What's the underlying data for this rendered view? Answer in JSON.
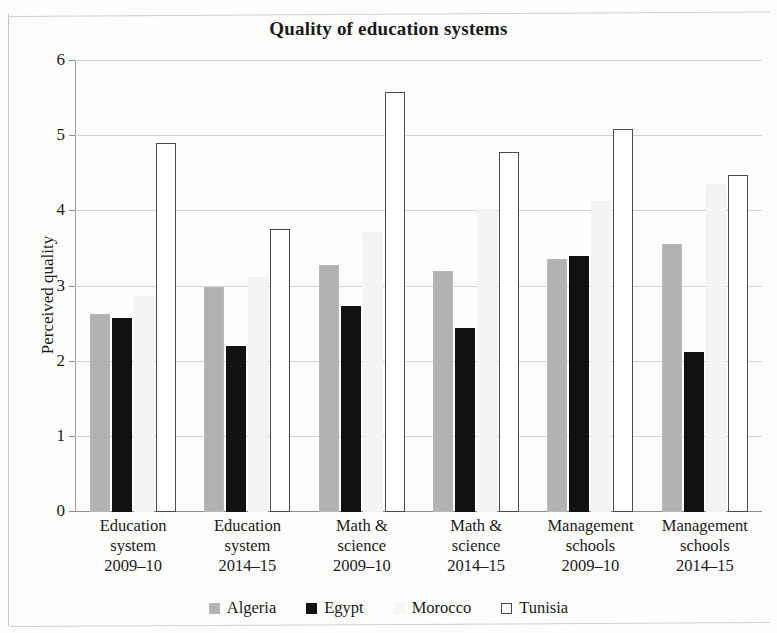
{
  "chart_data": {
    "type": "bar",
    "title": "Quality of education systems",
    "xlabel": "",
    "ylabel": "Perceived quality",
    "ylim": [
      0,
      6
    ],
    "ytick_labels": [
      "6",
      "5",
      "4",
      "3",
      "2",
      "1",
      "0"
    ],
    "yticks": [
      6,
      5,
      4,
      3,
      2,
      1,
      0
    ],
    "grid": true,
    "legend_position": "bottom",
    "categories": [
      "Education system 2009–10",
      "Education system 2014–15",
      "Math & science 2009–10",
      "Math & science 2014–15",
      "Management schools 2009–10",
      "Management schools 2014–15"
    ],
    "category_lines": [
      [
        "Education",
        "system",
        "2009–10"
      ],
      [
        "Education",
        "system",
        "2014–15"
      ],
      [
        "Math &",
        "science",
        "2009–10"
      ],
      [
        "Math &",
        "science",
        "2014–15"
      ],
      [
        "Management",
        "schools",
        "2009–10"
      ],
      [
        "Management",
        "schools",
        "2014–15"
      ]
    ],
    "series": [
      {
        "name": "Algeria",
        "color": "#b2b2b2",
        "values": [
          2.63,
          2.99,
          3.29,
          3.2,
          3.36,
          3.57
        ]
      },
      {
        "name": "Egypt",
        "color": "#111111",
        "values": [
          2.58,
          2.21,
          2.74,
          2.45,
          3.41,
          2.13
        ]
      },
      {
        "name": "Morocco",
        "color": "#f4f4f2",
        "values": [
          2.87,
          3.12,
          3.73,
          4.03,
          4.14,
          4.36
        ]
      },
      {
        "name": "Tunisia",
        "color": "#ffffff",
        "values": [
          4.91,
          3.76,
          5.59,
          4.79,
          5.09,
          4.48
        ]
      }
    ]
  },
  "legend": {
    "items": [
      {
        "label": "Algeria",
        "key": "algeria"
      },
      {
        "label": "Egypt",
        "key": "egypt"
      },
      {
        "label": "Morocco",
        "key": "morocco"
      },
      {
        "label": "Tunisia",
        "key": "tunisia"
      }
    ]
  }
}
